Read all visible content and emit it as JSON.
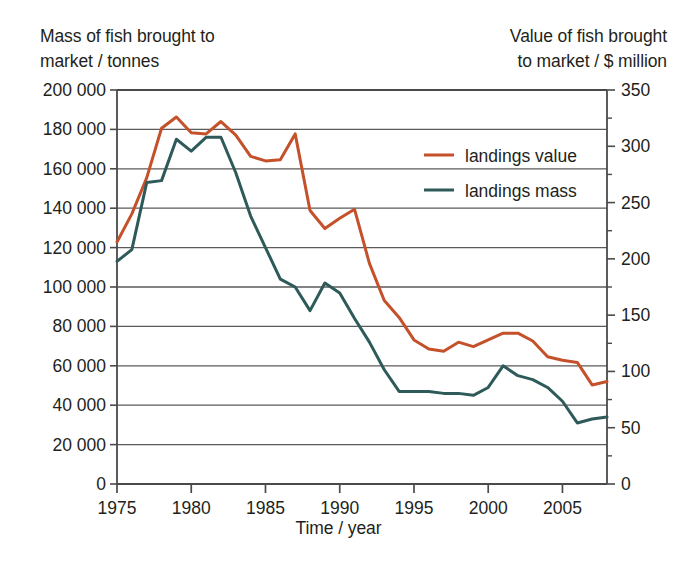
{
  "chart_data": {
    "type": "line",
    "title": "",
    "xlabel": "Time / year",
    "ylabel": "Mass of fish brought to\nmarket / tonnes",
    "y2label": "Value of fish brought\nto market / $ million",
    "xlim": [
      1975,
      2008
    ],
    "ylim": [
      0,
      200000
    ],
    "y2lim": [
      0,
      350
    ],
    "xticks": [
      1975,
      1980,
      1985,
      1990,
      1995,
      2000,
      2005
    ],
    "xtick_labels": [
      "1975",
      "1980",
      "1985",
      "1990",
      "1995",
      "2000",
      "2005"
    ],
    "yticks": [
      0,
      20000,
      40000,
      60000,
      80000,
      100000,
      120000,
      140000,
      160000,
      180000,
      200000
    ],
    "ytick_labels": [
      "0",
      "20 000",
      "40 000",
      "60 000",
      "80 000",
      "100 000",
      "120 000",
      "140 000",
      "160 000",
      "180 000",
      "200 000"
    ],
    "y2ticks": [
      0,
      50,
      100,
      150,
      200,
      250,
      300,
      350
    ],
    "y2tick_labels": [
      "0",
      "50",
      "100",
      "150",
      "200",
      "250",
      "300",
      "350"
    ],
    "y2_minor_ticks": [
      25,
      75,
      125,
      175,
      225,
      275,
      325
    ],
    "grid": "horizontal",
    "legend_position": "upper-right-inside",
    "x": [
      1975,
      1976,
      1977,
      1978,
      1979,
      1980,
      1981,
      1982,
      1983,
      1984,
      1985,
      1986,
      1987,
      1988,
      1989,
      1990,
      1991,
      1992,
      1993,
      1994,
      1995,
      1996,
      1997,
      1998,
      1999,
      2000,
      2001,
      2002,
      2003,
      2004,
      2005,
      2006,
      2007,
      2008
    ],
    "series": [
      {
        "name": "landings value",
        "axis": "right",
        "color": "#c4512a",
        "units": "$ million",
        "values": [
          215,
          240,
          272,
          316,
          326,
          312,
          311,
          322,
          310,
          291,
          287,
          288,
          311,
          243,
          227,
          236,
          244,
          196,
          163,
          148,
          128,
          120,
          118,
          126,
          122,
          128,
          134,
          134,
          127,
          113,
          110,
          108,
          88,
          91
        ]
      },
      {
        "name": "landings mass",
        "axis": "left",
        "color": "#2e5a59",
        "units": "tonnes",
        "values": [
          113000,
          119000,
          153000,
          154000,
          175000,
          169000,
          176000,
          176000,
          158000,
          136000,
          120000,
          104000,
          100000,
          88000,
          102000,
          97000,
          84000,
          72000,
          58000,
          47000,
          47000,
          47000,
          46000,
          46000,
          45000,
          49000,
          60000,
          55000,
          53000,
          49000,
          42000,
          31000,
          33000,
          34000
        ]
      }
    ]
  },
  "legend": {
    "entries": [
      {
        "label": "landings value",
        "color": "#c4512a"
      },
      {
        "label": "landings mass",
        "color": "#2e5a59"
      }
    ]
  }
}
